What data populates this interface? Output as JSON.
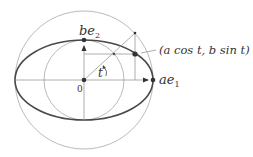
{
  "diagram": {
    "origin": {
      "x": 84,
      "y": 80
    },
    "a": 69,
    "b": 40,
    "t_point": {
      "outer": {
        "x": 135,
        "y": 33
      },
      "ellipse": {
        "x": 135,
        "y": 54
      },
      "inner": {
        "x": 114,
        "y": 54
      }
    },
    "labels": {
      "origin": "0",
      "be2_main": "be",
      "be2_sub": "2",
      "ae1_main": "ae",
      "ae1_sub": "1",
      "angle": "t",
      "point": "(a cos t, b sin t)"
    },
    "colors": {
      "ellipse": "#444444",
      "circles": "#999999",
      "lines": "#888888",
      "points": "#333333"
    }
  }
}
